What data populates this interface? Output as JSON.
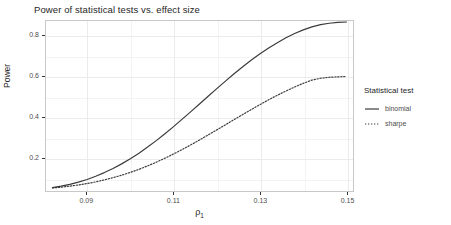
{
  "chart_data": {
    "type": "line",
    "title": "Power of statistical tests vs. effect size",
    "xlabel": "ρ",
    "xlabel_sub": "1",
    "ylabel": "Power",
    "xlim": [
      0.0805,
      0.1515
    ],
    "ylim": [
      0.035,
      0.875
    ],
    "xticks": [
      0.09,
      0.11,
      0.13,
      0.15
    ],
    "xtick_labels": [
      "0.09",
      "0.11",
      "0.13",
      "0.15"
    ],
    "yticks": [
      0.2,
      0.4,
      0.6,
      0.8
    ],
    "ytick_labels": [
      "0.2",
      "0.4",
      "0.6",
      "0.8"
    ],
    "grid": true,
    "legend_position": "right",
    "legend_title": "Statistical test",
    "x": [
      0.082,
      0.084,
      0.086,
      0.088,
      0.09,
      0.092,
      0.094,
      0.096,
      0.098,
      0.1,
      0.102,
      0.104,
      0.106,
      0.108,
      0.11,
      0.112,
      0.114,
      0.116,
      0.118,
      0.12,
      0.122,
      0.124,
      0.126,
      0.128,
      0.13,
      0.132,
      0.134,
      0.136,
      0.138,
      0.14,
      0.142,
      0.144,
      0.146,
      0.148,
      0.15
    ],
    "series": [
      {
        "name": "binomial",
        "linestyle": "solid",
        "color": "#3b3b3b",
        "values": [
          0.052,
          0.059,
          0.068,
          0.079,
          0.092,
          0.108,
          0.126,
          0.146,
          0.169,
          0.194,
          0.222,
          0.252,
          0.284,
          0.318,
          0.353,
          0.39,
          0.427,
          0.465,
          0.503,
          0.541,
          0.578,
          0.614,
          0.649,
          0.682,
          0.713,
          0.742,
          0.768,
          0.792,
          0.813,
          0.831,
          0.846,
          0.857,
          0.864,
          0.868,
          0.87
        ]
      },
      {
        "name": "sharpe",
        "linestyle": "dotted",
        "color": "#3b3b3b",
        "values": [
          0.05,
          0.054,
          0.059,
          0.065,
          0.072,
          0.08,
          0.09,
          0.101,
          0.113,
          0.127,
          0.142,
          0.159,
          0.177,
          0.197,
          0.218,
          0.24,
          0.263,
          0.287,
          0.312,
          0.337,
          0.362,
          0.388,
          0.413,
          0.438,
          0.462,
          0.486,
          0.508,
          0.529,
          0.549,
          0.567,
          0.583,
          0.592,
          0.597,
          0.599,
          0.601
        ]
      }
    ]
  },
  "legend": {
    "title": "Statistical test",
    "entries": [
      {
        "label": "binomial",
        "style": "solid"
      },
      {
        "label": "sharpe",
        "style": "dotted"
      }
    ]
  }
}
